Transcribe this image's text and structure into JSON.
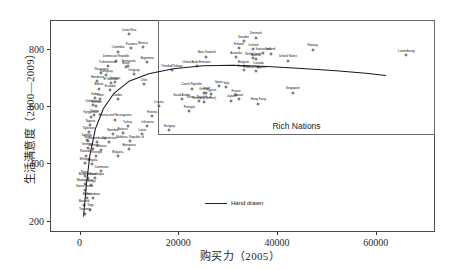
{
  "chart_data": {
    "type": "scatter",
    "title": "",
    "xlabel": "购买力（2005）",
    "ylabel": "生活满意度（2000—2009）",
    "xlim": [
      -6000,
      72000
    ],
    "ylim": [
      160,
      900
    ],
    "xticks": [
      0,
      20000,
      40000,
      60000
    ],
    "xticklabels": [
      "0",
      "20000",
      "40000",
      "60000"
    ],
    "yticks": [
      200,
      400,
      600,
      800
    ],
    "yticklabels": [
      "200",
      "400",
      "600",
      "800"
    ],
    "grid": false,
    "legend": {
      "position": "bottom-center",
      "entries": [
        "Hand drawn"
      ]
    },
    "annotations": [
      {
        "text": "Rich Nations",
        "x": 40000,
        "y": 420,
        "kind": "box-label"
      }
    ],
    "boxes": [
      {
        "name": "Rich Nations",
        "x0": 16500,
        "x1": 72000,
        "y0": 440,
        "y1": 900
      }
    ],
    "series": [
      {
        "name": "Hand drawn",
        "type": "line",
        "points": [
          [
            800,
            215
          ],
          [
            1400,
            330
          ],
          [
            2100,
            430
          ],
          [
            3200,
            520
          ],
          [
            4800,
            590
          ],
          [
            7000,
            645
          ],
          [
            10000,
            686
          ],
          [
            14000,
            712
          ],
          [
            19000,
            730
          ],
          [
            25000,
            740
          ],
          [
            31000,
            742
          ],
          [
            38000,
            738
          ],
          [
            45000,
            731
          ],
          [
            52000,
            723
          ],
          [
            58000,
            714
          ],
          [
            62000,
            706
          ]
        ]
      },
      {
        "name": "Countries",
        "type": "scatter",
        "points": [
          {
            "label": "Costa Rica",
            "x": 9800,
            "y": 855
          },
          {
            "label": "Panama",
            "x": 10300,
            "y": 805
          },
          {
            "label": "Mexico",
            "x": 12600,
            "y": 808
          },
          {
            "label": "Colombia",
            "x": 7600,
            "y": 793
          },
          {
            "label": "Dominican Republic",
            "x": 7200,
            "y": 762
          },
          {
            "label": "Argentina",
            "x": 13500,
            "y": 757
          },
          {
            "label": "Turkmenistan",
            "x": 5500,
            "y": 742
          },
          {
            "label": "Venezuela",
            "x": 9700,
            "y": 744
          },
          {
            "label": "Brazil",
            "x": 9200,
            "y": 740
          },
          {
            "label": "Sweden",
            "x": 33000,
            "y": 830
          },
          {
            "label": "Denmark",
            "x": 35500,
            "y": 842
          },
          {
            "label": "Finland",
            "x": 32000,
            "y": 805
          },
          {
            "label": "Iceland",
            "x": 35000,
            "y": 802
          },
          {
            "label": "Norway",
            "x": 47000,
            "y": 800
          },
          {
            "label": "Switzerland",
            "x": 37000,
            "y": 788
          },
          {
            "label": "Ireland",
            "x": 38500,
            "y": 786
          },
          {
            "label": "New Zealand",
            "x": 25500,
            "y": 776
          },
          {
            "label": "Australia",
            "x": 31500,
            "y": 774
          },
          {
            "label": "Netherlands",
            "x": 35000,
            "y": 770
          },
          {
            "label": "Austria",
            "x": 35500,
            "y": 768
          },
          {
            "label": "United States",
            "x": 42000,
            "y": 762
          },
          {
            "label": "Luxembourg",
            "x": 66000,
            "y": 780
          },
          {
            "label": "Nicaragua",
            "x": 4200,
            "y": 718
          },
          {
            "label": "Paraguay",
            "x": 5200,
            "y": 712
          },
          {
            "label": "Uruguay",
            "x": 10800,
            "y": 714
          },
          {
            "label": "Trinidad/Tobago",
            "x": 18500,
            "y": 728
          },
          {
            "label": "United Arab Emirates",
            "x": 23500,
            "y": 742
          },
          {
            "label": "Belgium",
            "x": 33000,
            "y": 742
          },
          {
            "label": "Canada",
            "x": 36000,
            "y": 740
          },
          {
            "label": "Germany",
            "x": 33000,
            "y": 728
          },
          {
            "label": "United Kingdom",
            "x": 35500,
            "y": 726
          },
          {
            "label": "Honduras",
            "x": 3400,
            "y": 690
          },
          {
            "label": "Jamaica",
            "x": 6900,
            "y": 688
          },
          {
            "label": "El Salvador",
            "x": 6200,
            "y": 684
          },
          {
            "label": "Chile",
            "x": 12800,
            "y": 680
          },
          {
            "label": "Bolivia",
            "x": 3700,
            "y": 664
          },
          {
            "label": "Ecuador",
            "x": 6000,
            "y": 660
          },
          {
            "label": "Spain",
            "x": 28000,
            "y": 672
          },
          {
            "label": "Italy",
            "x": 29500,
            "y": 668
          },
          {
            "label": "Czech Republic",
            "x": 22500,
            "y": 664
          },
          {
            "label": "Greece",
            "x": 25000,
            "y": 648
          },
          {
            "label": "Cyprus",
            "x": 26500,
            "y": 646
          },
          {
            "label": "Israel",
            "x": 25500,
            "y": 650
          },
          {
            "label": "Singapore",
            "x": 43000,
            "y": 650
          },
          {
            "label": "Gabon",
            "x": 3000,
            "y": 632
          },
          {
            "label": "Laos",
            "x": 4000,
            "y": 628
          },
          {
            "label": "Jordan",
            "x": 7500,
            "y": 626
          },
          {
            "label": "Saudi Arabia",
            "x": 20500,
            "y": 628
          },
          {
            "label": "Kuwait",
            "x": 32000,
            "y": 626
          },
          {
            "label": "France",
            "x": 31500,
            "y": 642
          },
          {
            "label": "Japan",
            "x": 30500,
            "y": 622
          },
          {
            "label": "Hong Kong",
            "x": 36000,
            "y": 612
          },
          {
            "label": "Korea, Republic of",
            "x": 24000,
            "y": 620
          },
          {
            "label": "Germany (former)",
            "x": 25000,
            "y": 616
          },
          {
            "label": "Uzbekistan",
            "x": 2500,
            "y": 606
          },
          {
            "label": "Vietnam",
            "x": 3200,
            "y": 602
          },
          {
            "label": "Croatia",
            "x": 15800,
            "y": 604
          },
          {
            "label": "Portugal",
            "x": 22000,
            "y": 586
          },
          {
            "label": "Yemen",
            "x": 2800,
            "y": 572
          },
          {
            "label": "Kyrgyzstan",
            "x": 2100,
            "y": 566
          },
          {
            "label": "Bosnia and Herzegovina",
            "x": 7000,
            "y": 556
          },
          {
            "label": "Estonia",
            "x": 14500,
            "y": 568
          },
          {
            "label": "Nigeria",
            "x": 2000,
            "y": 536
          },
          {
            "label": "Turkey",
            "x": 9500,
            "y": 534
          },
          {
            "label": "Lithuania",
            "x": 13500,
            "y": 534
          },
          {
            "label": "Hungary",
            "x": 18000,
            "y": 520
          },
          {
            "label": "Tajikistan",
            "x": 1600,
            "y": 512
          },
          {
            "label": "Belarus",
            "x": 8500,
            "y": 508
          },
          {
            "label": "Namibia",
            "x": 6500,
            "y": 504
          },
          {
            "label": "Latvia",
            "x": 12500,
            "y": 506
          },
          {
            "label": "Zambia",
            "x": 1200,
            "y": 486
          },
          {
            "label": "Nepal",
            "x": 1500,
            "y": 480
          },
          {
            "label": "Luxembourg ",
            "x": 3400,
            "y": 478
          },
          {
            "label": "Uzbekistan ",
            "x": 5800,
            "y": 478
          },
          {
            "label": "Moldova, Republic of",
            "x": 10000,
            "y": 482
          },
          {
            "label": "Senegal",
            "x": 1400,
            "y": 456
          },
          {
            "label": "Guinea",
            "x": 2600,
            "y": 452
          },
          {
            "label": "Albania",
            "x": 4200,
            "y": 450
          },
          {
            "label": "Botswana",
            "x": 9800,
            "y": 452
          },
          {
            "label": "Rwanda",
            "x": 1000,
            "y": 430
          },
          {
            "label": "Georgia",
            "x": 3200,
            "y": 428
          },
          {
            "label": "Bulgaria",
            "x": 7500,
            "y": 428
          },
          {
            "label": "Ethiopia",
            "x": 900,
            "y": 404
          },
          {
            "label": "Angola",
            "x": 2400,
            "y": 400
          },
          {
            "label": "Cameroon",
            "x": 4200,
            "y": 376
          },
          {
            "label": "Niger",
            "x": 800,
            "y": 358
          },
          {
            "label": "Burkina Faso",
            "x": 1400,
            "y": 352
          },
          {
            "label": "Mozambique",
            "x": 3000,
            "y": 352
          },
          {
            "label": "Madagascar",
            "x": 900,
            "y": 330
          },
          {
            "label": "Kenya",
            "x": 2200,
            "y": 326
          },
          {
            "label": "Sierra Leone",
            "x": 800,
            "y": 310
          },
          {
            "label": "Benin",
            "x": 1200,
            "y": 282
          },
          {
            "label": "Zimbabwe",
            "x": 2500,
            "y": 282
          },
          {
            "label": "Burundi",
            "x": 700,
            "y": 258
          },
          {
            "label": "Togo",
            "x": 2000,
            "y": 242
          },
          {
            "label": "Tanzania",
            "x": 900,
            "y": 228
          }
        ]
      }
    ]
  }
}
